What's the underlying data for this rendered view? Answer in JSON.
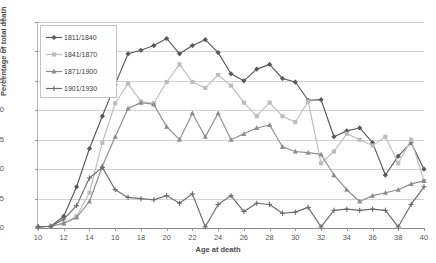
{
  "title_strip": "",
  "chart_data": {
    "type": "line",
    "title": "",
    "xlabel": "Age at death",
    "ylabel": "Percentage of total death",
    "xlim": [
      10,
      40
    ],
    "ylim": [
      0,
      35
    ],
    "ytick_labels": [
      "0",
      "5",
      "10",
      "15",
      "20",
      "25",
      "30",
      "35"
    ],
    "ytick_values": [
      0,
      5,
      10,
      15,
      20,
      25,
      30,
      35
    ],
    "xtick_labels": [
      "10",
      "12",
      "14",
      "16",
      "18",
      "20",
      "22",
      "24",
      "26",
      "28",
      "30",
      "32",
      "34",
      "36",
      "38",
      "40"
    ],
    "xtick_values": [
      10,
      12,
      14,
      16,
      18,
      20,
      22,
      24,
      26,
      28,
      30,
      32,
      34,
      36,
      38,
      40
    ],
    "grid": true,
    "legend_position": "top-left",
    "x": [
      10,
      11,
      12,
      13,
      14,
      15,
      16,
      17,
      18,
      19,
      20,
      21,
      22,
      23,
      24,
      25,
      26,
      27,
      28,
      29,
      30,
      31,
      32,
      33,
      34,
      35,
      36,
      37,
      38,
      39,
      40
    ],
    "series": [
      {
        "name": "1811/1840",
        "color": "#5a5a5a",
        "marker": "diamond",
        "values": [
          0.2,
          0.3,
          2.0,
          7.0,
          13.5,
          19.0,
          24.4,
          29.6,
          30.2,
          31.0,
          32.2,
          29.6,
          31.0,
          32.0,
          29.8,
          26.2,
          25.0,
          27.0,
          27.8,
          25.4,
          24.8,
          21.7,
          21.8,
          15.5,
          16.5,
          17.0,
          14.5,
          9.0,
          12.2,
          14.5,
          10.0
        ]
      },
      {
        "name": "1841/1870",
        "color": "#bdbdbd",
        "marker": "square",
        "values": [
          0.2,
          0.3,
          0.8,
          2.0,
          6.0,
          14.5,
          21.2,
          24.5,
          21.5,
          21.2,
          24.8,
          27.8,
          24.8,
          23.8,
          26.0,
          24.2,
          21.3,
          19.0,
          21.3,
          19.0,
          18.0,
          21.5,
          11.0,
          13.0,
          16.0,
          15.0,
          14.0,
          15.5,
          11.0,
          15.0,
          8.0
        ]
      },
      {
        "name": "1871/1900",
        "color": "#8d8d8d",
        "marker": "triangle",
        "values": [
          0.2,
          0.3,
          0.8,
          1.8,
          4.5,
          10.5,
          15.5,
          20.3,
          21.3,
          21.0,
          17.2,
          15.0,
          19.5,
          15.5,
          19.5,
          15.0,
          16.0,
          17.0,
          17.5,
          13.8,
          13.0,
          12.8,
          12.5,
          9.0,
          6.5,
          4.5,
          5.5,
          6.0,
          6.5,
          7.5,
          8.0
        ]
      },
      {
        "name": "1901/1930",
        "color": "#6b6b6b",
        "marker": "cross",
        "values": [
          0.2,
          0.3,
          1.5,
          3.8,
          8.5,
          10.3,
          6.5,
          5.2,
          5.0,
          4.8,
          5.5,
          4.2,
          5.8,
          0.2,
          4.0,
          5.5,
          2.8,
          4.2,
          4.0,
          2.5,
          2.7,
          3.5,
          0.2,
          3.0,
          3.2,
          3.0,
          3.2,
          3.0,
          0.2,
          4.0,
          7.0
        ]
      }
    ]
  }
}
